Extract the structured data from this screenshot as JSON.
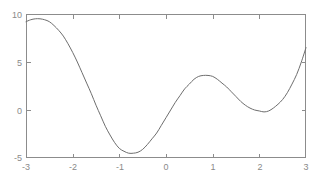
{
  "figure": {
    "background_color": "#ffffff",
    "axis_color": "#8c8c8c",
    "label_color": "#8a8a8a",
    "curve_color": "#6e6e6e"
  },
  "chart_data": {
    "type": "line",
    "title": "",
    "xlabel": "",
    "ylabel": "",
    "xlim": [
      -3,
      3
    ],
    "ylim": [
      -5,
      10
    ],
    "grid": false,
    "legend": null,
    "box": true,
    "xticks": [
      -3,
      -2,
      -1,
      0,
      1,
      2,
      3
    ],
    "xticklabels": [
      "-3",
      "-2",
      "-1",
      "0",
      "1",
      "2",
      "3"
    ],
    "yticks": [
      -5,
      0,
      5,
      10
    ],
    "yticklabels": [
      "-5",
      "0",
      "5",
      "10"
    ],
    "xminorticks": [
      -2.5,
      -1.5,
      -0.5,
      0.5,
      1.5,
      2.5
    ],
    "yminorticks": [
      -2.5,
      2.5,
      7.5
    ],
    "series": [
      {
        "name": "curve",
        "x": [
          -3.0,
          -2.9,
          -2.8,
          -2.7,
          -2.6,
          -2.5,
          -2.4,
          -2.3,
          -2.2,
          -2.1,
          -2.0,
          -1.9,
          -1.8,
          -1.7,
          -1.6,
          -1.5,
          -1.4,
          -1.3,
          -1.2,
          -1.1,
          -1.0,
          -0.9,
          -0.8,
          -0.7,
          -0.6,
          -0.5,
          -0.4,
          -0.3,
          -0.2,
          -0.1,
          0.0,
          0.1,
          0.2,
          0.3,
          0.4,
          0.5,
          0.6,
          0.7,
          0.8,
          0.9,
          1.0,
          1.1,
          1.2,
          1.3,
          1.4,
          1.5,
          1.6,
          1.7,
          1.8,
          1.9,
          2.0,
          2.1,
          2.2,
          2.3,
          2.4,
          2.5,
          2.6,
          2.7,
          2.8,
          2.9,
          3.0
        ],
        "y": [
          9.2,
          9.4,
          9.5,
          9.5,
          9.4,
          9.2,
          8.8,
          8.3,
          7.7,
          6.9,
          6.0,
          5.0,
          3.9,
          2.8,
          1.7,
          0.5,
          -0.6,
          -1.7,
          -2.6,
          -3.4,
          -4.0,
          -4.3,
          -4.5,
          -4.5,
          -4.4,
          -4.1,
          -3.6,
          -3.0,
          -2.4,
          -1.6,
          -0.8,
          0.0,
          0.8,
          1.5,
          2.2,
          2.7,
          3.2,
          3.5,
          3.6,
          3.6,
          3.5,
          3.2,
          2.8,
          2.4,
          1.9,
          1.4,
          0.9,
          0.5,
          0.2,
          0.0,
          -0.1,
          -0.2,
          -0.1,
          0.2,
          0.6,
          1.1,
          1.8,
          2.7,
          3.7,
          5.0,
          6.5
        ]
      }
    ],
    "features": {
      "left_endpoint": {
        "x": -3,
        "y": 9.2
      },
      "local_max_1": {
        "x": -2.75,
        "y": 9.5
      },
      "global_min": {
        "x": -0.67,
        "y": -4.5
      },
      "local_max_2": {
        "x": 0.87,
        "y": 3.6
      },
      "local_min_2": {
        "x": 2.05,
        "y": -0.2
      },
      "right_endpoint": {
        "x": 3,
        "y": 6.5
      },
      "zero_crossings": [
        -1.55,
        0.05,
        1.9,
        2.25
      ]
    }
  },
  "axes_geometry": {
    "left_px": 26,
    "right_px": 306,
    "top_px": 14,
    "bottom_px": 158
  }
}
